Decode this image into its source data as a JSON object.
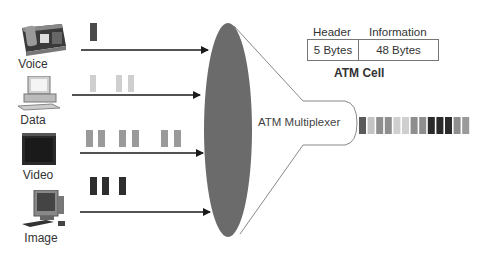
{
  "sources": [
    {
      "label": "Voice",
      "icon": "telephone-icon",
      "cells": [
        {
          "x": 90,
          "w": 7
        }
      ],
      "cell_y": 23,
      "cell_h": 18,
      "cell_color": "#4a4a4a",
      "arrow": {
        "y": 50,
        "x1": 81,
        "x2": 208
      }
    },
    {
      "label": "Data",
      "icon": "desktop-computer-icon",
      "cells": [
        {
          "x": 90,
          "w": 6
        },
        {
          "x": 116,
          "w": 6
        },
        {
          "x": 128,
          "w": 6
        }
      ],
      "cell_y": 75,
      "cell_h": 17,
      "cell_color": "#cfcfcf",
      "arrow": {
        "y": 95,
        "x1": 72,
        "x2": 200
      }
    },
    {
      "label": "Video",
      "icon": "video-monitor-icon",
      "cells": [
        {
          "x": 86,
          "w": 7
        },
        {
          "x": 98,
          "w": 7
        },
        {
          "x": 119,
          "w": 7
        },
        {
          "x": 132,
          "w": 7
        },
        {
          "x": 161,
          "w": 7
        },
        {
          "x": 174,
          "w": 7
        }
      ],
      "cell_y": 130,
      "cell_h": 17,
      "cell_color": "#9a9a9a",
      "arrow": {
        "y": 153,
        "x1": 80,
        "x2": 203
      }
    },
    {
      "label": "Image",
      "icon": "workstation-icon",
      "cells": [
        {
          "x": 90,
          "w": 7
        },
        {
          "x": 102,
          "w": 7
        },
        {
          "x": 119,
          "w": 7
        }
      ],
      "cell_y": 177,
      "cell_h": 18,
      "cell_color": "#2e2e2e",
      "arrow": {
        "y": 212,
        "x1": 80,
        "x2": 210
      }
    }
  ],
  "multiplexer": {
    "label": "ATM Multiplexer",
    "fill": "#6b6b6b"
  },
  "atm_cell": {
    "header_label": "Header",
    "information_label": "Information",
    "header_size": "5 Bytes",
    "information_size": "48 Bytes",
    "title": "ATM Cell"
  },
  "output_stream": {
    "cells": [
      "#5a5a5a",
      "#c4c4c4",
      "#8e8e8e",
      "#8e8e8e",
      "#cfcfcf",
      "#cfcfcf",
      "#8e8e8e",
      "#8e8e8e",
      "#2a2a2a",
      "#2a2a2a",
      "#2a2a2a",
      "#8e8e8e",
      "#9a9a9a"
    ]
  }
}
